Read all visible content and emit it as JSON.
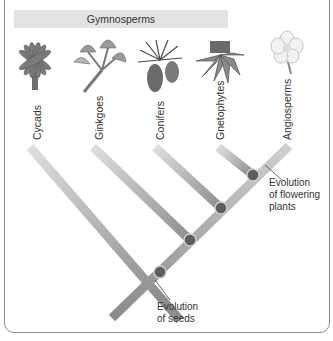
{
  "group": {
    "label": "Gymnosperms"
  },
  "taxa": [
    {
      "label": "Cycads",
      "icon": "cycad-plant-icon"
    },
    {
      "label": "Ginkgoes",
      "icon": "ginkgo-leaves-icon"
    },
    {
      "label": "Conifers",
      "icon": "conifer-cones-icon"
    },
    {
      "label": "Gnetophytes",
      "icon": "gnetophyte-plant-icon"
    },
    {
      "label": "Angiosperms",
      "icon": "flower-icon"
    }
  ],
  "annotations": {
    "seeds": {
      "line1": "Evolution",
      "line2": "of seeds"
    },
    "flowering": {
      "line1": "Evolution",
      "line2": "of flowering",
      "line3": "plants"
    }
  },
  "colors": {
    "branch_light": "#d6d6d6",
    "branch_dark": "#8c8c8c",
    "node_fill": "#5e5e5e",
    "node_ring": "#c8c8c8",
    "bar_bg": "#e3e3e3",
    "frame": "#8a8a8a"
  }
}
